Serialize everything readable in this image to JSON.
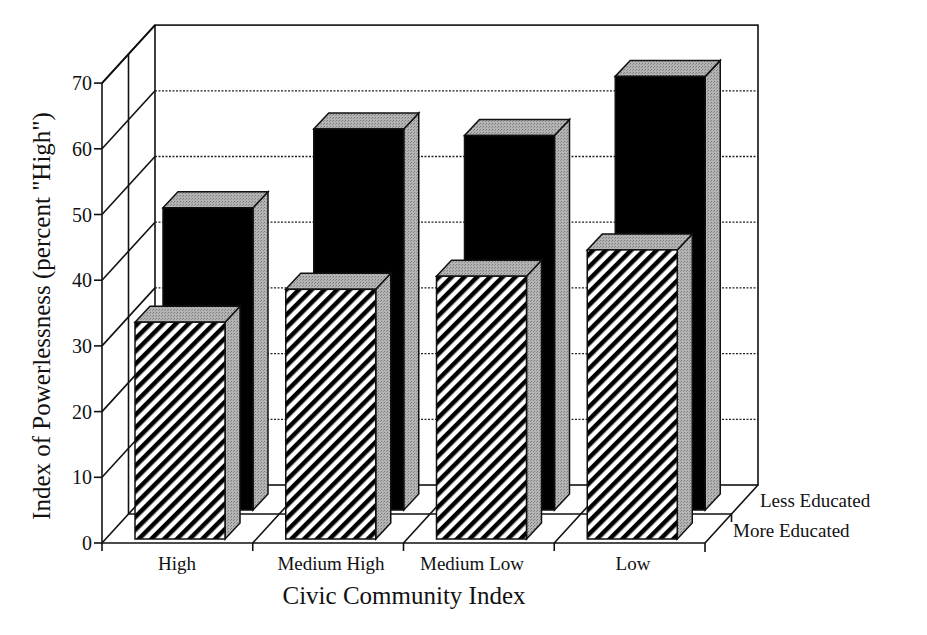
{
  "chart_data": {
    "type": "bar",
    "subtype": "3d-grouped-bar",
    "title": "",
    "xlabel": "Civic Community Index",
    "ylabel": "Index of Powerlessness (percent \"High\")",
    "categories": [
      "High",
      "Medium High",
      "Medium Low",
      "Low"
    ],
    "series": [
      {
        "name": "More Educated",
        "row": "front",
        "pattern": "diagonal-hatch",
        "values": [
          33,
          38,
          40,
          44
        ]
      },
      {
        "name": "Less Educated",
        "row": "back",
        "pattern": "solid-black",
        "values": [
          46,
          58,
          57,
          66
        ]
      }
    ],
    "yticks": [
      0,
      10,
      20,
      30,
      40,
      50,
      60,
      70
    ],
    "ylim": [
      0,
      70
    ],
    "grid": "dotted horizontal lines on back wall",
    "legend": {
      "position": "right, as depth-axis labels",
      "entries": [
        "Less Educated",
        "More Educated"
      ]
    },
    "colors": {
      "less_educated": "#000000",
      "more_educated_hatch": "#000000",
      "side_faces": "#a8a8a8",
      "top_faces": "#a0a0a0",
      "background": "#ffffff"
    }
  }
}
